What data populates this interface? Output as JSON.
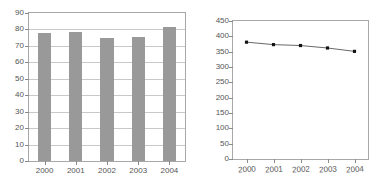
{
  "chart_data": [
    {
      "type": "bar",
      "panel": "left",
      "title": "",
      "xlabel": "",
      "ylabel": "",
      "categories": [
        "2000",
        "2001",
        "2002",
        "2003",
        "2004"
      ],
      "values": [
        78,
        78.5,
        75,
        75.5,
        81.5
      ],
      "ylim": [
        0,
        90
      ],
      "ytick_step": 10,
      "yticks": [
        0,
        10,
        20,
        30,
        40,
        50,
        60,
        70,
        80,
        90
      ],
      "ytick_labels": [
        "0",
        "10",
        "20",
        "30",
        "40",
        "50",
        "60",
        "70",
        "80",
        "90"
      ],
      "grid": true,
      "grid_axis": "y",
      "legend": "none",
      "bar_color": "#999999",
      "frame_color": "#a8a8a8",
      "grid_color": "#c9c9c9",
      "tick_label_color": "#555555"
    },
    {
      "type": "line",
      "panel": "right",
      "title": "",
      "xlabel": "",
      "ylabel": "",
      "categories": [
        "2000",
        "2001",
        "2002",
        "2003",
        "2004"
      ],
      "values": [
        381,
        373,
        370,
        362,
        351
      ],
      "ylim": [
        0,
        450
      ],
      "ytick_step": 50,
      "yticks": [
        0,
        50,
        100,
        150,
        200,
        250,
        300,
        350,
        400,
        450
      ],
      "ytick_labels": [
        "0",
        "50",
        "100",
        "150",
        "200",
        "250",
        "300",
        "350",
        "400",
        "450"
      ],
      "grid": false,
      "legend": "none",
      "line_color": "#555555",
      "marker": "square",
      "marker_color": "#111111",
      "frame_color": "#a8a8a8",
      "tick_label_color": "#555555"
    }
  ]
}
